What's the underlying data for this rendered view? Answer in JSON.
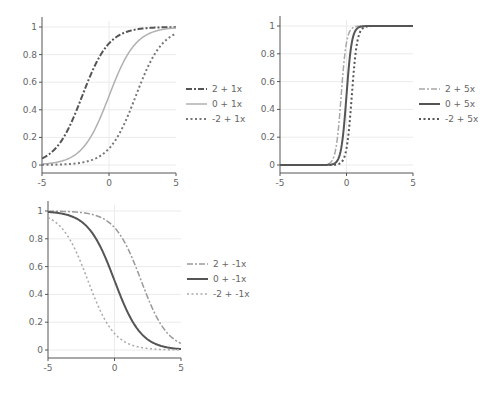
{
  "chart_data": [
    {
      "type": "line",
      "title": "",
      "xlabel": "",
      "ylabel": "",
      "function": "logistic: y = 1 / (1 + exp(-(a + b*x)))",
      "xlim": [
        -5,
        5
      ],
      "ylim": [
        0,
        1
      ],
      "x_ticks": [
        "-5",
        "0",
        "5"
      ],
      "y_ticks": [
        "0",
        "0.2",
        "0.4",
        "0.6",
        "0.8",
        "1"
      ],
      "grid": true,
      "legend_position": "right",
      "series": [
        {
          "name": "2 + 1x",
          "a": 2,
          "b": 1,
          "style": "dashdot",
          "color": "#555555",
          "width": 2,
          "x": [
            -5,
            -2.5,
            0,
            2.5,
            5
          ],
          "values": [
            0.047,
            0.378,
            0.881,
            0.989,
            0.999
          ]
        },
        {
          "name": "0 + 1x",
          "a": 0,
          "b": 1,
          "style": "solid",
          "color": "#b0b0b0",
          "width": 1.5,
          "x": [
            -5,
            -2.5,
            0,
            2.5,
            5
          ],
          "values": [
            0.007,
            0.076,
            0.5,
            0.924,
            0.993
          ]
        },
        {
          "name": "-2 + 1x",
          "a": -2,
          "b": 1,
          "style": "dotted",
          "color": "#777777",
          "width": 2,
          "x": [
            -5,
            -2.5,
            0,
            2.5,
            5
          ],
          "values": [
            0.001,
            0.011,
            0.119,
            0.622,
            0.953
          ]
        }
      ]
    },
    {
      "type": "line",
      "title": "",
      "xlabel": "",
      "ylabel": "",
      "function": "logistic: y = 1 / (1 + exp(-(a + b*x)))",
      "xlim": [
        -5,
        5
      ],
      "ylim": [
        0,
        1
      ],
      "x_ticks": [
        "-5",
        "0",
        "5"
      ],
      "y_ticks": [
        "0",
        "0.2",
        "0.4",
        "0.6",
        "0.8",
        "1"
      ],
      "grid": true,
      "legend_position": "right",
      "series": [
        {
          "name": "2 + 5x",
          "a": 2,
          "b": 5,
          "style": "dashdot",
          "color": "#a8a8a8",
          "width": 1.5,
          "x": [
            -5,
            -1,
            -0.4,
            0,
            1,
            5
          ],
          "values": [
            0.0,
            0.047,
            0.5,
            0.881,
            1.0,
            1.0
          ]
        },
        {
          "name": "0 + 5x",
          "a": 0,
          "b": 5,
          "style": "solid",
          "color": "#555555",
          "width": 2,
          "x": [
            -5,
            -1,
            -0.4,
            0,
            1,
            5
          ],
          "values": [
            0.0,
            0.007,
            0.119,
            0.5,
            0.993,
            1.0
          ]
        },
        {
          "name": "-2 + 5x",
          "a": -2,
          "b": 5,
          "style": "dotted",
          "color": "#555555",
          "width": 2,
          "x": [
            -5,
            -1,
            -0.4,
            0,
            1,
            5
          ],
          "values": [
            0.0,
            0.001,
            0.018,
            0.119,
            0.953,
            1.0
          ]
        }
      ]
    },
    {
      "type": "line",
      "title": "",
      "xlabel": "",
      "ylabel": "",
      "function": "logistic: y = 1 / (1 + exp(-(a + b*x)))",
      "xlim": [
        -5,
        5
      ],
      "ylim": [
        0,
        1
      ],
      "x_ticks": [
        "-5",
        "0",
        "5"
      ],
      "y_ticks": [
        "0",
        "0.2",
        "0.4",
        "0.6",
        "0.8",
        "1"
      ],
      "grid": true,
      "legend_position": "right",
      "series": [
        {
          "name": "2 + -1x",
          "a": 2,
          "b": -1,
          "style": "dashdot",
          "color": "#9a9a9a",
          "width": 1.5,
          "x": [
            -5,
            -2.5,
            0,
            2.5,
            5
          ],
          "values": [
            0.999,
            0.989,
            0.881,
            0.378,
            0.047
          ]
        },
        {
          "name": "0 + -1x",
          "a": 0,
          "b": -1,
          "style": "solid",
          "color": "#555555",
          "width": 2,
          "x": [
            -5,
            -2.5,
            0,
            2.5,
            5
          ],
          "values": [
            0.993,
            0.924,
            0.5,
            0.076,
            0.007
          ]
        },
        {
          "name": "-2 + -1x",
          "a": -2,
          "b": -1,
          "style": "dotted",
          "color": "#aaaaaa",
          "width": 1.5,
          "x": [
            -5,
            -2.5,
            0,
            2.5,
            5
          ],
          "values": [
            0.953,
            0.622,
            0.119,
            0.011,
            0.001
          ]
        }
      ]
    }
  ],
  "layout": {
    "panels": [
      {
        "x0": 42,
        "x1": 176,
        "y0": 165,
        "y1": 27,
        "axis_y": 173,
        "legend_x": 186,
        "legend_y": 89
      },
      {
        "x0": 280,
        "x1": 413,
        "y0": 165,
        "y1": 26,
        "axis_y": 173,
        "legend_x": 419,
        "legend_y": 89
      },
      {
        "x0": 48,
        "x1": 181,
        "y0": 350,
        "y1": 211,
        "axis_y": 358,
        "legend_x": 187,
        "legend_y": 264
      }
    ]
  }
}
